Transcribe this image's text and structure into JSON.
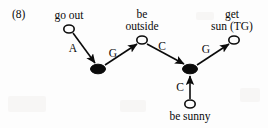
{
  "figure": {
    "example_number": "(8)",
    "caption_prefix": "(8)"
  },
  "nodes": [
    {
      "id": "go_out",
      "label": "go out",
      "label_lines": [
        "go out"
      ],
      "type": "open",
      "cx": 69,
      "cy": 29,
      "rx": 5.2,
      "ry": 4.0,
      "label_x": 69,
      "label_y": 9
    },
    {
      "id": "be_outside",
      "label": "be outside",
      "label_lines": [
        "be",
        "outside"
      ],
      "type": "open",
      "cx": 142,
      "cy": 40,
      "rx": 5.2,
      "ry": 4.0,
      "label_x": 142,
      "label_y": 8
    },
    {
      "id": "get_sun",
      "label": "get sun (TG)",
      "label_lines": [
        "get",
        "sun (TG)"
      ],
      "type": "open",
      "cx": 234,
      "cy": 40,
      "rx": 5.2,
      "ry": 4.0,
      "label_x": 232,
      "label_y": 8
    },
    {
      "id": "be_sunny",
      "label": "be sunny",
      "label_lines": [
        "be sunny"
      ],
      "type": "open",
      "cx": 190,
      "cy": 104,
      "rx": 5.2,
      "ry": 4.0,
      "label_x": 190,
      "label_y": 110
    },
    {
      "id": "event1",
      "label": "",
      "label_lines": [],
      "type": "filled",
      "cx": 98,
      "cy": 69,
      "rx": 7.5,
      "ry": 4.8,
      "label_x": 0,
      "label_y": 0
    },
    {
      "id": "event2",
      "label": "",
      "label_lines": [],
      "type": "filled",
      "cx": 190,
      "cy": 69,
      "rx": 7.5,
      "ry": 4.8,
      "label_x": 0,
      "label_y": 0
    }
  ],
  "edges": [
    {
      "id": "e1",
      "label": "A",
      "from": "go_out",
      "to": "event1",
      "x1": 73,
      "y1": 33,
      "x2": 95,
      "y2": 63,
      "label_x": 73,
      "label_y": 48
    },
    {
      "id": "e2",
      "label": "G",
      "from": "event1",
      "to": "be_outside",
      "x1": 105,
      "y1": 65,
      "x2": 137,
      "y2": 44,
      "label_x": 113,
      "label_y": 53
    },
    {
      "id": "e3",
      "label": "C",
      "from": "be_outside",
      "to": "event2",
      "x1": 147,
      "y1": 44,
      "x2": 184,
      "y2": 64,
      "label_x": 162,
      "label_y": 46
    },
    {
      "id": "e4",
      "label": "G",
      "from": "event2",
      "to": "get_sun",
      "x1": 197,
      "y1": 65,
      "x2": 229,
      "y2": 44,
      "label_x": 206,
      "label_y": 49
    },
    {
      "id": "e5",
      "label": "C",
      "from": "be_sunny",
      "to": "event2",
      "x1": 190,
      "y1": 99,
      "x2": 190,
      "y2": 76,
      "label_x": 180,
      "label_y": 87
    }
  ],
  "style": {
    "ink_color": "#0b0b0b",
    "background_color": "#fdfdfd",
    "stroke_width": 1.6
  }
}
